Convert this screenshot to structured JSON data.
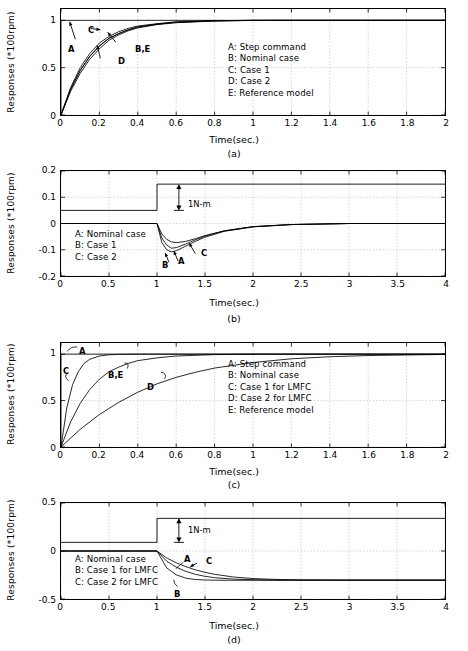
{
  "figure": {
    "axis_title": "Time(sec.)",
    "ylabel": "Responses (*100rpm)"
  },
  "panels": [
    {
      "caption": "(a)",
      "ylabel": "Responses (*100rpm)",
      "xlabel": "Time(sec.)",
      "xticks": [
        "0",
        "0.2",
        "0.4",
        "0.6",
        "0.8",
        "1",
        "1.2",
        "1.4",
        "1.6",
        "1.8",
        "2"
      ],
      "yticks": [
        "0",
        "0.5",
        "1"
      ],
      "legend": [
        "A: Step command",
        "B: Nominal case",
        "C: Case 1",
        "D: Case 2",
        "E: Reference model"
      ],
      "annotations": [
        "A",
        "C",
        "D",
        "B,E"
      ]
    },
    {
      "caption": "(b)",
      "ylabel": "Responses (*100rpm)",
      "xlabel": "Time(sec.)",
      "xticks": [
        "0",
        "0.5",
        "1",
        "1.5",
        "2",
        "2.5",
        "3",
        "3.5",
        "4"
      ],
      "yticks": [
        "-0.2",
        "-0.1",
        "0",
        "0.1",
        "0.2"
      ],
      "legend": [
        "A: Nominal case",
        "B: Case 1",
        "C: Case 2"
      ],
      "annotations": [
        "B",
        "A",
        "C"
      ],
      "torque_label": "1N-m"
    },
    {
      "caption": "(c)",
      "ylabel": "Responses (*100rpm)",
      "xlabel": "Time(sec.)",
      "xticks": [
        "0",
        "0.2",
        "0.4",
        "0.6",
        "0.8",
        "1",
        "1.2",
        "1.4",
        "1.6",
        "1.8",
        "2"
      ],
      "yticks": [
        "0",
        "0.5",
        "1"
      ],
      "legend": [
        "A: Step command",
        "B: Nominal case",
        "C: Case 1 for LMFC",
        "D: Case 2 for LMFC",
        "E: Reference model"
      ],
      "annotations": [
        "A",
        "C",
        "B,E",
        "D"
      ]
    },
    {
      "caption": "(d)",
      "ylabel": "Responses (*100rpm)",
      "xlabel": "Time(sec.)",
      "xticks": [
        "0",
        "0.5",
        "1",
        "1.5",
        "2",
        "2.5",
        "3",
        "3.5",
        "4"
      ],
      "yticks": [
        "-0.5",
        "0",
        "0.5"
      ],
      "legend": [
        "A: Nominal case",
        "B: Case 1 for LMFC",
        "C: Case 2 for LMFC"
      ],
      "annotations": [
        "A",
        "C",
        "B"
      ],
      "torque_label": "1N-m"
    }
  ],
  "chart_data": [
    {
      "type": "line",
      "panel": "(a)",
      "title": "",
      "xlabel": "Time(sec.)",
      "ylabel": "Responses (*100rpm)",
      "xlim": [
        0,
        2
      ],
      "ylim": [
        0,
        1.12
      ],
      "grid": true,
      "series": [
        {
          "name": "A: Step command",
          "x": [
            0,
            0,
            2
          ],
          "y": [
            0,
            1,
            1
          ]
        },
        {
          "name": "B: Nominal case",
          "x": [
            0,
            0.05,
            0.1,
            0.15,
            0.2,
            0.25,
            0.3,
            0.35,
            0.4,
            0.5,
            0.6,
            0.8,
            1.0,
            1.4,
            2.0
          ],
          "y": [
            0,
            0.27,
            0.47,
            0.62,
            0.73,
            0.81,
            0.86,
            0.9,
            0.93,
            0.96,
            0.98,
            0.995,
            1.0,
            1.0,
            1.0
          ]
        },
        {
          "name": "C: Case 1",
          "x": [
            0,
            0.05,
            0.1,
            0.15,
            0.2,
            0.25,
            0.3,
            0.35,
            0.4,
            0.5,
            0.6,
            0.8,
            1.0,
            1.4,
            2.0
          ],
          "y": [
            0,
            0.29,
            0.5,
            0.65,
            0.76,
            0.83,
            0.88,
            0.915,
            0.94,
            0.965,
            0.985,
            0.997,
            1.0,
            1.0,
            1.0
          ]
        },
        {
          "name": "D: Case 2",
          "x": [
            0,
            0.05,
            0.1,
            0.15,
            0.2,
            0.25,
            0.3,
            0.35,
            0.4,
            0.5,
            0.6,
            0.8,
            1.0,
            1.4,
            2.0
          ],
          "y": [
            0,
            0.25,
            0.44,
            0.59,
            0.7,
            0.79,
            0.845,
            0.89,
            0.92,
            0.955,
            0.975,
            0.993,
            0.999,
            1.0,
            1.0
          ]
        },
        {
          "name": "E: Reference model",
          "x": [
            0,
            0.05,
            0.1,
            0.15,
            0.2,
            0.25,
            0.3,
            0.35,
            0.4,
            0.5,
            0.6,
            0.8,
            1.0,
            1.4,
            2.0
          ],
          "y": [
            0,
            0.27,
            0.47,
            0.62,
            0.73,
            0.81,
            0.86,
            0.9,
            0.93,
            0.96,
            0.98,
            0.995,
            1.0,
            1.0,
            1.0
          ]
        }
      ]
    },
    {
      "type": "line",
      "panel": "(b)",
      "title": "",
      "xlabel": "Time(sec.)",
      "ylabel": "Responses (*100rpm)",
      "xlim": [
        0,
        4
      ],
      "ylim": [
        -0.2,
        0.2
      ],
      "grid": true,
      "disturbance_step": {
        "name": "torque step",
        "t": 1,
        "from": 0.05,
        "to": 0.15,
        "label": "1N-m"
      },
      "series": [
        {
          "name": "A: Nominal case",
          "x": [
            0,
            1.0,
            1.05,
            1.1,
            1.15,
            1.2,
            1.3,
            1.4,
            1.5,
            1.7,
            2.0,
            2.4,
            3.0,
            4.0
          ],
          "y": [
            0,
            0,
            -0.055,
            -0.082,
            -0.094,
            -0.092,
            -0.078,
            -0.062,
            -0.048,
            -0.028,
            -0.012,
            -0.004,
            0,
            0
          ]
        },
        {
          "name": "B: Case 1",
          "x": [
            0,
            1.0,
            1.05,
            1.1,
            1.15,
            1.2,
            1.3,
            1.4,
            1.5,
            1.7,
            2.0,
            2.4,
            3.0,
            4.0
          ],
          "y": [
            0,
            0,
            -0.072,
            -0.1,
            -0.108,
            -0.104,
            -0.086,
            -0.068,
            -0.052,
            -0.03,
            -0.013,
            -0.004,
            0,
            0
          ]
        },
        {
          "name": "C: Case 2",
          "x": [
            0,
            1.0,
            1.05,
            1.1,
            1.15,
            1.2,
            1.3,
            1.4,
            1.5,
            1.7,
            2.0,
            2.4,
            3.0,
            4.0
          ],
          "y": [
            0,
            0,
            -0.04,
            -0.06,
            -0.07,
            -0.073,
            -0.068,
            -0.058,
            -0.046,
            -0.028,
            -0.012,
            -0.004,
            0,
            0
          ]
        }
      ]
    },
    {
      "type": "line",
      "panel": "(c)",
      "title": "",
      "xlabel": "Time(sec.)",
      "ylabel": "Responses (*100rpm)",
      "xlim": [
        0,
        2
      ],
      "ylim": [
        0,
        1.12
      ],
      "grid": true,
      "series": [
        {
          "name": "A: Step command",
          "x": [
            0,
            0,
            2
          ],
          "y": [
            0,
            1,
            1
          ]
        },
        {
          "name": "C: Case 1 for LMFC",
          "x": [
            0,
            0.03,
            0.06,
            0.09,
            0.12,
            0.15,
            0.2,
            0.25,
            0.3,
            0.4,
            0.6,
            1.0,
            2.0
          ],
          "y": [
            0,
            0.42,
            0.67,
            0.81,
            0.9,
            0.945,
            0.98,
            0.993,
            0.998,
            1.0,
            1.0,
            1.0,
            1.0
          ]
        },
        {
          "name": "B,E: Nominal case / Reference model",
          "x": [
            0,
            0.05,
            0.1,
            0.15,
            0.2,
            0.25,
            0.3,
            0.35,
            0.4,
            0.5,
            0.6,
            0.8,
            1.0,
            1.4,
            2.0
          ],
          "y": [
            0,
            0.27,
            0.47,
            0.62,
            0.73,
            0.81,
            0.86,
            0.9,
            0.93,
            0.96,
            0.98,
            0.995,
            1.0,
            1.0,
            1.0
          ]
        },
        {
          "name": "D: Case 2 for LMFC",
          "x": [
            0,
            0.1,
            0.2,
            0.3,
            0.4,
            0.5,
            0.6,
            0.7,
            0.8,
            1.0,
            1.2,
            1.4,
            1.6,
            2.0
          ],
          "y": [
            0,
            0.19,
            0.35,
            0.48,
            0.59,
            0.68,
            0.75,
            0.805,
            0.85,
            0.91,
            0.95,
            0.972,
            0.985,
            0.997
          ]
        }
      ]
    },
    {
      "type": "line",
      "panel": "(d)",
      "title": "",
      "xlabel": "Time(sec.)",
      "ylabel": "Responses (*100rpm)",
      "xlim": [
        0,
        4
      ],
      "ylim": [
        -0.5,
        0.5
      ],
      "grid": true,
      "disturbance_step": {
        "name": "torque step",
        "t": 1,
        "from": 0.09,
        "to": 0.34,
        "label": "1N-m"
      },
      "series": [
        {
          "name": "A: Nominal case",
          "x": [
            0,
            1.0,
            1.1,
            1.2,
            1.3,
            1.4,
            1.5,
            1.6,
            1.8,
            2.0,
            2.2,
            2.5,
            3.0,
            4.0
          ],
          "y": [
            0,
            0,
            -0.105,
            -0.168,
            -0.212,
            -0.243,
            -0.264,
            -0.278,
            -0.293,
            -0.299,
            -0.302,
            -0.303,
            -0.303,
            -0.303
          ]
        },
        {
          "name": "B: Case 1 for LMFC",
          "x": [
            0,
            1.0,
            1.1,
            1.2,
            1.3,
            1.4,
            1.5,
            1.6,
            1.8,
            2.0,
            2.2,
            2.5,
            3.0,
            4.0
          ],
          "y": [
            0,
            0,
            -0.175,
            -0.248,
            -0.283,
            -0.297,
            -0.302,
            -0.304,
            -0.305,
            -0.305,
            -0.305,
            -0.305,
            -0.305,
            -0.305
          ]
        },
        {
          "name": "C: Case 2 for LMFC",
          "x": [
            0,
            1.0,
            1.1,
            1.2,
            1.3,
            1.4,
            1.5,
            1.6,
            1.8,
            2.0,
            2.2,
            2.5,
            3.0,
            4.0
          ],
          "y": [
            0,
            0,
            -0.072,
            -0.122,
            -0.163,
            -0.196,
            -0.222,
            -0.243,
            -0.271,
            -0.287,
            -0.295,
            -0.301,
            -0.303,
            -0.303
          ]
        }
      ]
    }
  ]
}
